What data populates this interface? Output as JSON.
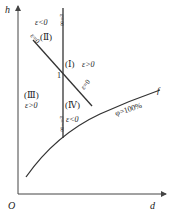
{
  "diagram": {
    "axes": {
      "y_label": "h",
      "x_label": "d",
      "origin_label": "O"
    },
    "lines": {
      "vertical_line_top_label": "ε=∞",
      "vertical_line_bottom_label": "ε=−∞",
      "diagonal_line_label_top": "ε=0",
      "diagonal_line_label_bottom": "ε=0",
      "intersection_label": "1"
    },
    "regions": [
      {
        "numeral": "(Ⅰ)",
        "condition": "ε>0"
      },
      {
        "numeral": "(Ⅱ)",
        "condition": "ε<0"
      },
      {
        "numeral": "(Ⅲ)",
        "condition": "ε>0"
      },
      {
        "numeral": "(Ⅳ)",
        "condition": "ε<0"
      }
    ],
    "curve": {
      "end_label": "f",
      "label": "φ=100%"
    },
    "colors": {
      "line": "#333333",
      "axis": "#444444"
    }
  }
}
